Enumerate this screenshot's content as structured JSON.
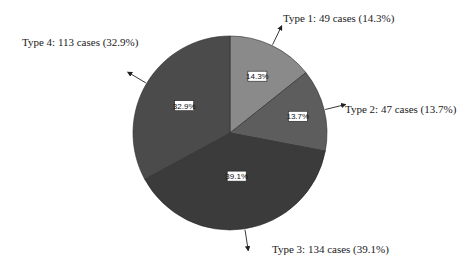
{
  "chart_data": {
    "type": "pie",
    "title": "",
    "start_angle": "12 o'clock",
    "direction": "clockwise",
    "slices": [
      {
        "label": "Type 1",
        "count": 49,
        "percent": 14.3,
        "pct_label": "14.3%",
        "callout": "Type 1: 49 cases (14.3%)",
        "color": "#8a8a8a"
      },
      {
        "label": "Type 2",
        "count": 47,
        "percent": 13.7,
        "pct_label": "13.7%",
        "callout": "Type 2: 47 cases (13.7%)",
        "color": "#5d5d5d"
      },
      {
        "label": "Type 3",
        "count": 134,
        "percent": 39.1,
        "pct_label": "39.1%",
        "callout": "Type 3: 134 cases (39.1%)",
        "color": "#3b3b3b"
      },
      {
        "label": "Type 4",
        "count": 113,
        "percent": 32.9,
        "pct_label": "32.9%",
        "callout": "Type 4: 113 cases (32.9%)",
        "color": "#4b4b4b"
      }
    ],
    "legend": "none"
  }
}
